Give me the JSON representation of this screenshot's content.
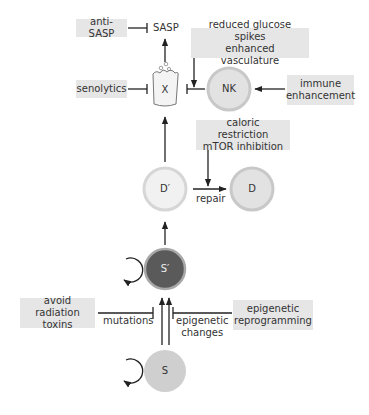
{
  "nodes": {
    "X": "X",
    "NK": "NK",
    "D_prime": "D′",
    "D": "D",
    "S_prime": "S′",
    "S": "S"
  },
  "labels": {
    "sasp": "SASP",
    "repair": "repair",
    "mutations": "mutations",
    "epigenetic_changes_1": "epigenetic",
    "epigenetic_changes_2": "changes"
  },
  "interventions": {
    "anti_sasp": "anti-SASP",
    "senolytics": "senolytics",
    "glucose_1": "reduced glucose spikes",
    "glucose_2": "enhanced vasculature",
    "immune_1": "immune",
    "immune_2": "enhancement",
    "caloric_1": "caloric restriction",
    "caloric_2": "mTOR inhibition",
    "radiation_1": "avoid radiation",
    "radiation_2": "toxins",
    "reprog_1": "epigenetic",
    "reprog_2": "reprogramming"
  },
  "colors": {
    "box_bg": "#e6e6e6",
    "node_light": "#e4e4e4",
    "node_mid": "#cfcfcf",
    "node_dark": "#5a5a5a",
    "line": "#222222"
  }
}
